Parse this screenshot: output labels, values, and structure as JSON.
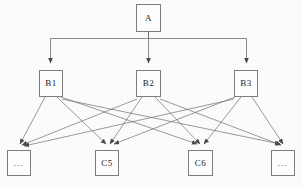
{
  "diagram": {
    "type": "tree-dag",
    "background_color": "#fbfbfb",
    "node_fill_color": "#fdfdfd",
    "node_border_color": "#7d7d7d",
    "edge_color": "#6e6e6e",
    "text_color": "#1a1a1a",
    "levels": [
      {
        "name": "root-level",
        "nodes": [
          {
            "id": "A",
            "label": "A",
            "x": 136,
            "y": 4,
            "w": 25,
            "h": 28
          }
        ]
      },
      {
        "name": "middle-level",
        "nodes": [
          {
            "id": "B1",
            "label": "B1",
            "x": 39,
            "y": 70,
            "w": 24,
            "h": 27
          },
          {
            "id": "B2",
            "label": "B2",
            "x": 136,
            "y": 70,
            "w": 25,
            "h": 27
          },
          {
            "id": "B3",
            "label": "B3",
            "x": 234,
            "y": 70,
            "w": 24,
            "h": 27
          }
        ]
      },
      {
        "name": "leaf-level",
        "nodes": [
          {
            "id": "L1",
            "label": "...",
            "x": 7,
            "y": 150,
            "w": 24,
            "h": 26
          },
          {
            "id": "C5",
            "label": "C5",
            "x": 95,
            "y": 150,
            "w": 24,
            "h": 26
          },
          {
            "id": "C6",
            "label": "C6",
            "x": 188,
            "y": 150,
            "w": 25,
            "h": 26
          },
          {
            "id": "L2",
            "label": "...",
            "x": 271,
            "y": 150,
            "w": 24,
            "h": 26
          }
        ]
      }
    ],
    "edges": [
      {
        "from": "A",
        "to": "B1",
        "style": "orthogonal",
        "arrow": true
      },
      {
        "from": "A",
        "to": "B2",
        "style": "orthogonal",
        "arrow": true
      },
      {
        "from": "A",
        "to": "B3",
        "style": "orthogonal",
        "arrow": true
      },
      {
        "from": "B1",
        "to": "L1",
        "style": "straight",
        "arrow": true
      },
      {
        "from": "B1",
        "to": "C5",
        "style": "straight",
        "arrow": true
      },
      {
        "from": "B1",
        "to": "C6",
        "style": "straight",
        "arrow": true
      },
      {
        "from": "B1",
        "to": "L2",
        "style": "straight",
        "arrow": true
      },
      {
        "from": "B2",
        "to": "L1",
        "style": "straight",
        "arrow": true
      },
      {
        "from": "B2",
        "to": "C5",
        "style": "straight",
        "arrow": true
      },
      {
        "from": "B2",
        "to": "C6",
        "style": "straight",
        "arrow": true
      },
      {
        "from": "B2",
        "to": "L2",
        "style": "straight",
        "arrow": true
      },
      {
        "from": "B3",
        "to": "L1",
        "style": "straight",
        "arrow": true
      },
      {
        "from": "B3",
        "to": "C5",
        "style": "straight",
        "arrow": true
      },
      {
        "from": "B3",
        "to": "C6",
        "style": "straight",
        "arrow": true
      },
      {
        "from": "B3",
        "to": "L2",
        "style": "straight",
        "arrow": true
      }
    ],
    "bus_y": 38
  }
}
